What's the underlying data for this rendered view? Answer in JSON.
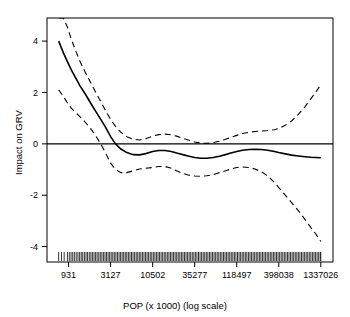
{
  "chart_data": {
    "type": "line",
    "title": "",
    "xlabel": "POP (x 1000) (log scale)",
    "ylabel": "Impact on GRV",
    "grid": false,
    "legend": null,
    "x_scale": "log",
    "x_tick_labels": [
      "931",
      "3127",
      "10502",
      "35277",
      "118497",
      "398038",
      "1337026"
    ],
    "x_tick_values": [
      931,
      3127,
      10502,
      35277,
      118497,
      398038,
      1337026
    ],
    "y_tick_labels": [
      "-4",
      "-2",
      "0",
      "2",
      "4"
    ],
    "y_tick_values": [
      -4,
      -2,
      0,
      2,
      4
    ],
    "ylim": [
      -4.6,
      4.9
    ],
    "xlim": [
      500,
      1900000
    ],
    "zero_line": 0,
    "series": [
      {
        "name": "smooth-fit",
        "style": "solid",
        "x": [
          700,
          800,
          900,
          1000,
          1150,
          1300,
          1500,
          1750,
          2000,
          2300,
          2700,
          3127,
          3600,
          4200,
          5000,
          6000,
          7200,
          8600,
          10502,
          12500,
          15000,
          18000,
          21000,
          25000,
          30000,
          35277,
          42000,
          50000,
          60000,
          72000,
          86000,
          100000,
          118497,
          140000,
          170000,
          200000,
          240000,
          290000,
          350000,
          398038,
          480000,
          580000,
          700000,
          850000,
          1000000,
          1150000,
          1337026
        ],
        "y": [
          4.0,
          3.55,
          3.2,
          2.9,
          2.55,
          2.25,
          1.95,
          1.6,
          1.3,
          1.0,
          0.65,
          0.28,
          0.0,
          -0.2,
          -0.34,
          -0.42,
          -0.43,
          -0.38,
          -0.3,
          -0.26,
          -0.26,
          -0.3,
          -0.36,
          -0.42,
          -0.48,
          -0.53,
          -0.56,
          -0.56,
          -0.53,
          -0.48,
          -0.42,
          -0.36,
          -0.3,
          -0.25,
          -0.22,
          -0.21,
          -0.22,
          -0.25,
          -0.3,
          -0.34,
          -0.39,
          -0.44,
          -0.47,
          -0.5,
          -0.52,
          -0.53,
          -0.54
        ]
      },
      {
        "name": "upper-confidence-band",
        "style": "dashed",
        "x": [
          700,
          800,
          900,
          1000,
          1150,
          1300,
          1500,
          1750,
          2000,
          2300,
          2700,
          3127,
          3600,
          4200,
          5000,
          6000,
          7200,
          8600,
          10502,
          12500,
          15000,
          18000,
          21000,
          25000,
          30000,
          35277,
          42000,
          50000,
          60000,
          72000,
          86000,
          100000,
          118497,
          140000,
          170000,
          200000,
          240000,
          290000,
          350000,
          398038,
          480000,
          580000,
          700000,
          850000,
          1000000,
          1150000,
          1337026
        ],
        "y": [
          4.9,
          4.9,
          4.55,
          4.1,
          3.6,
          3.2,
          2.8,
          2.4,
          2.05,
          1.7,
          1.3,
          0.95,
          0.68,
          0.45,
          0.28,
          0.18,
          0.15,
          0.2,
          0.3,
          0.36,
          0.38,
          0.35,
          0.3,
          0.22,
          0.14,
          0.07,
          0.03,
          0.02,
          0.05,
          0.1,
          0.18,
          0.25,
          0.33,
          0.4,
          0.45,
          0.48,
          0.5,
          0.52,
          0.55,
          0.6,
          0.72,
          0.9,
          1.15,
          1.45,
          1.75,
          2.0,
          2.3
        ]
      },
      {
        "name": "lower-confidence-band",
        "style": "dashed",
        "x": [
          700,
          800,
          900,
          1000,
          1150,
          1300,
          1500,
          1750,
          2000,
          2300,
          2700,
          3127,
          3600,
          4200,
          5000,
          6000,
          7200,
          8600,
          10502,
          12500,
          15000,
          18000,
          21000,
          25000,
          30000,
          35277,
          42000,
          50000,
          60000,
          72000,
          86000,
          100000,
          118497,
          140000,
          170000,
          200000,
          240000,
          290000,
          350000,
          398038,
          480000,
          580000,
          700000,
          850000,
          1000000,
          1150000,
          1337026
        ],
        "y": [
          2.1,
          1.85,
          1.6,
          1.4,
          1.2,
          1.05,
          0.85,
          0.6,
          0.35,
          0.05,
          -0.35,
          -0.75,
          -1.0,
          -1.12,
          -1.12,
          -1.05,
          -0.98,
          -0.95,
          -0.92,
          -0.88,
          -0.88,
          -0.95,
          -1.05,
          -1.15,
          -1.22,
          -1.25,
          -1.26,
          -1.24,
          -1.2,
          -1.12,
          -1.05,
          -0.98,
          -0.92,
          -0.9,
          -0.92,
          -0.98,
          -1.08,
          -1.25,
          -1.5,
          -1.7,
          -2.0,
          -2.3,
          -2.6,
          -2.95,
          -3.25,
          -3.5,
          -3.8
        ]
      }
    ],
    "rug_description": "dense rug plot of observation ticks along the bottom axis",
    "rug_x": [
      700,
      760,
      820,
      900,
      950,
      1000,
      1050,
      1100,
      1160,
      1220,
      1280,
      1340,
      1400,
      1470,
      1540,
      1610,
      1690,
      1770,
      1850,
      1940,
      2030,
      2120,
      2220,
      2320,
      2430,
      2540,
      2660,
      2780,
      2910,
      3040,
      3180,
      3330,
      3480,
      3640,
      3810,
      3990,
      4170,
      4360,
      4560,
      4770,
      4990,
      5220,
      5460,
      5710,
      5970,
      6250,
      6540,
      6840,
      7150,
      7480,
      7820,
      8180,
      8560,
      8950,
      9360,
      9790,
      10240,
      10710,
      11200,
      11710,
      12250,
      12810,
      13400,
      14020,
      14660,
      15330,
      16040,
      16780,
      17550,
      18360,
      19200,
      20080,
      21010,
      21970,
      22980,
      24030,
      25140,
      26290,
      27500,
      28760,
      30080,
      31460,
      32910,
      34420,
      36000,
      37650,
      39380,
      41190,
      43080,
      45060,
      47130,
      49300,
      51570,
      53940,
      56420,
      59010,
      61730,
      64570,
      67540,
      70650,
      73900,
      77300,
      80860,
      84580,
      88470,
      92540,
      96800,
      101250,
      105910,
      110780,
      115880,
      121210,
      126790,
      132620,
      138720,
      145100,
      151780,
      158760,
      166060,
      173700,
      181690,
      190050,
      198790,
      207940,
      217500,
      227510,
      237980,
      248930,
      260380,
      272360,
      284890,
      298000,
      311710,
      326050,
      341050,
      356740,
      373150,
      390320,
      408280,
      427060,
      446700,
      467250,
      488750,
      511230,
      534750,
      559350,
      585080,
      612000,
      640160,
      669610,
      700420,
      732640,
      766350,
      801600,
      838480,
      877060,
      917410,
      959620,
      1003770,
      1049950,
      1098250,
      1148770,
      1201610,
      1256890,
      1314710,
      1337026
    ]
  }
}
